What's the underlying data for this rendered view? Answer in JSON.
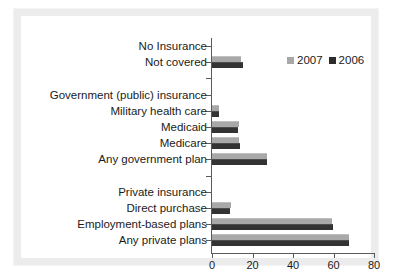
{
  "chart_data": {
    "type": "bar",
    "orientation": "horizontal",
    "title": "",
    "xlabel": "",
    "ylabel": "",
    "xlim": [
      0,
      80
    ],
    "xticks": [
      0,
      20,
      40,
      60,
      80
    ],
    "grid": false,
    "legend_position": "top-right",
    "categories": [
      "No Insurance",
      "Not covered",
      "",
      "Government (public) insurance",
      "Military health care",
      "Medicaid",
      "Medicare",
      "Any government plan",
      "",
      "Private insurance",
      "Direct purchase",
      "Employment-based plans",
      "Any private plans"
    ],
    "series": [
      {
        "name": "2007",
        "color": "#a8a8a8",
        "values": [
          null,
          14.5,
          null,
          null,
          3.5,
          13.2,
          13.5,
          27.3,
          null,
          null,
          9.5,
          59.3,
          67.5
        ]
      },
      {
        "name": "2006",
        "color": "#2b2b2b",
        "values": [
          null,
          15.5,
          null,
          null,
          3.6,
          12.9,
          13.6,
          27.0,
          null,
          null,
          9.0,
          59.7,
          67.9
        ]
      }
    ]
  },
  "legend": {
    "items": [
      {
        "label": "2007",
        "swatch": "legend-swatch-2007"
      },
      {
        "label": "2006",
        "swatch": "legend-swatch-2006"
      }
    ]
  },
  "axis": {
    "x_tick_labels": [
      "0",
      "20",
      "40",
      "60",
      "80"
    ]
  }
}
